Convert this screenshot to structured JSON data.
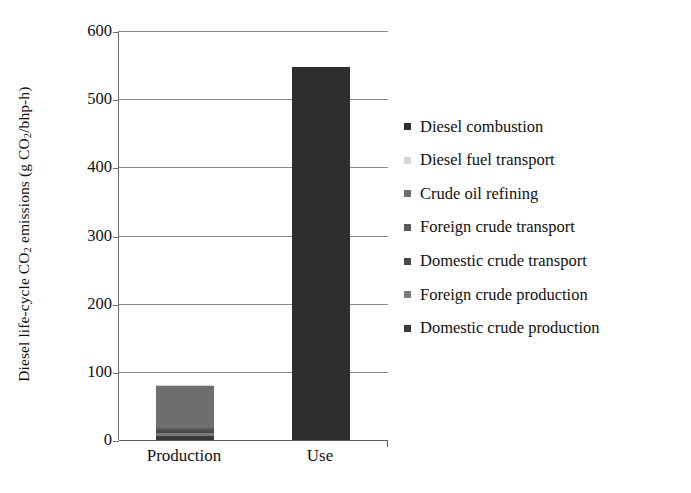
{
  "chart_data": {
    "type": "bar",
    "subtype": "stacked-bar",
    "title": "",
    "xlabel": "",
    "ylabel": "Diesel life-cycle CO2 emissions (g CO2/bhp-h)",
    "ylabel_parts": {
      "pre": "Diesel life-cycle CO",
      "sub1": "2",
      "mid": " emissions (g CO",
      "sub2": "2",
      "post": "/bhp-h)"
    },
    "categories": [
      "Production",
      "Use"
    ],
    "ylim": [
      0,
      600
    ],
    "yticks": [
      0,
      100,
      200,
      300,
      400,
      500,
      600
    ],
    "ytick_labels": [
      "0",
      "100",
      "200",
      "300",
      "400",
      "500",
      "600"
    ],
    "grid": true,
    "legend_position": "right",
    "series": [
      {
        "name": "Diesel combustion",
        "color": "#2e2e2e",
        "values": [
          0,
          547
        ]
      },
      {
        "name": "Diesel fuel transport",
        "color": "#d4d4d4",
        "values": [
          1,
          0
        ]
      },
      {
        "name": "Crude oil refining",
        "color": "#6e6e6e",
        "values": [
          62,
          0
        ]
      },
      {
        "name": "Foreign crude transport",
        "color": "#5a5a5a",
        "values": [
          3,
          0
        ]
      },
      {
        "name": "Domestic crude transport",
        "color": "#4a4a4a",
        "values": [
          4,
          0
        ]
      },
      {
        "name": "Foreign crude production",
        "color": "#7a7a7a",
        "values": [
          5,
          0
        ]
      },
      {
        "name": "Domestic crude production",
        "color": "#3a3a3a",
        "values": [
          6,
          0
        ]
      }
    ],
    "totals": [
      81,
      547
    ]
  },
  "legend": {
    "items": [
      {
        "label": "Diesel combustion"
      },
      {
        "label": "Diesel fuel transport"
      },
      {
        "label": "Crude oil refining"
      },
      {
        "label": "Foreign crude transport"
      },
      {
        "label": "Domestic crude transport"
      },
      {
        "label": "Foreign crude production"
      },
      {
        "label": "Domestic crude production"
      }
    ]
  },
  "axis": {
    "y_title": "Diesel life-cycle CO2 emissions (g CO2/bhp-h)",
    "x_categories": [
      "Production",
      "Use"
    ]
  },
  "colors": {
    "grid": "#8a8a8a",
    "axis": "#5a5a5a",
    "text": "#111111",
    "background": "#ffffff"
  }
}
